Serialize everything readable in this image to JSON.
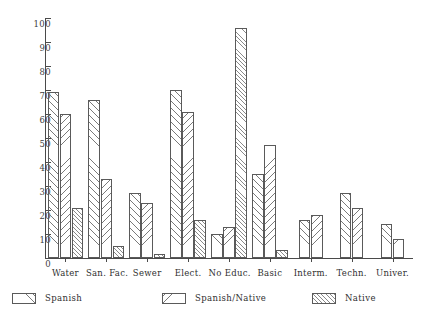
{
  "chart_data": {
    "type": "bar",
    "title": "",
    "subtitle": "",
    "xlabel": "",
    "ylabel": "",
    "ylim": [
      0,
      100
    ],
    "yticks": [
      0,
      10,
      20,
      30,
      40,
      50,
      60,
      70,
      80,
      90,
      100
    ],
    "ytick_labels": [
      "0",
      "10",
      "20",
      "30",
      "40",
      "50",
      "60",
      "70",
      "80",
      "90",
      "100"
    ],
    "grid": false,
    "legend_position": "below-axes",
    "categories": [
      "Water",
      "San. Fac.",
      "Sewer",
      "Elect.",
      "No Educ.",
      "Basic",
      "Interm.",
      "Techn.",
      "Univer."
    ],
    "series": [
      {
        "name": "Spanish",
        "pattern": "forward-diagonal-hatch",
        "values": [
          69,
          66,
          27,
          70,
          10,
          35,
          16,
          27,
          14
        ]
      },
      {
        "name": "Spanish/Native",
        "pattern": "backward-diagonal-hatch",
        "values": [
          60,
          33,
          23,
          61,
          13,
          47,
          18,
          21,
          8
        ]
      },
      {
        "name": "Native",
        "pattern": "dense-forward-diagonal-hatch",
        "values": [
          21,
          5,
          1.5,
          16,
          96,
          3.5,
          null,
          null,
          null
        ]
      }
    ]
  },
  "legend": {
    "items": [
      {
        "label": "Spanish",
        "pattern": "forward-diagonal-hatch"
      },
      {
        "label": "Spanish/Native",
        "pattern": "backward-diagonal-hatch"
      },
      {
        "label": "Native",
        "pattern": "dense-forward-diagonal-hatch"
      }
    ]
  },
  "colors": {
    "axis": "#4a4a4a",
    "bar_outline": "#5a5a5a",
    "hatch": "#7a7a7a",
    "text": "#2f2f2f",
    "background": "#ffffff"
  }
}
